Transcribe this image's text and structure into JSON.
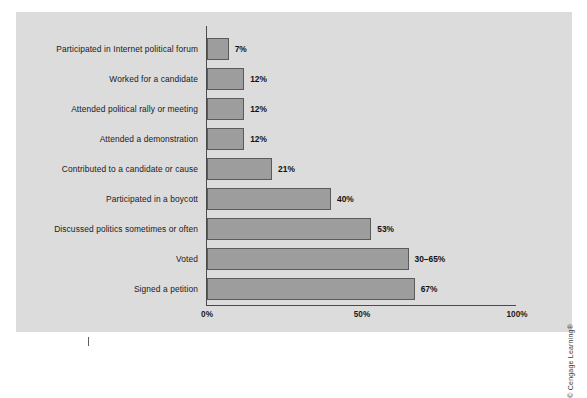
{
  "chart_data": {
    "type": "bar",
    "orientation": "horizontal",
    "title": "",
    "subtitle": "",
    "xlabel": "",
    "ylabel": "",
    "xlim": [
      0,
      100
    ],
    "grid": false,
    "legend": null,
    "categories": [
      "Participated in Internet political forum",
      "Worked for a candidate",
      "Attended political rally or meeting",
      "Attended a demonstration",
      "Contributed to a candidate or cause",
      "Participated in a boycott",
      "Discussed politics sometimes or often",
      "Voted",
      "Signed a petition"
    ],
    "values": [
      7,
      12,
      12,
      12,
      21,
      40,
      53,
      65,
      67
    ],
    "value_labels": [
      "7%",
      "12%",
      "12%",
      "12%",
      "21%",
      "40%",
      "53%",
      "30–65%",
      "67%"
    ],
    "xticks": [
      0,
      50,
      100
    ],
    "xtick_labels": [
      "0%",
      "50%",
      "100%"
    ],
    "colors": {
      "bar_fill": "#9d9d9d",
      "bar_stroke": "#5a5a5a",
      "axis": "#4a4a4a",
      "background": "#dcdcdc",
      "text": "#1a1a1a"
    }
  },
  "credit": "© Cengage Learning®"
}
